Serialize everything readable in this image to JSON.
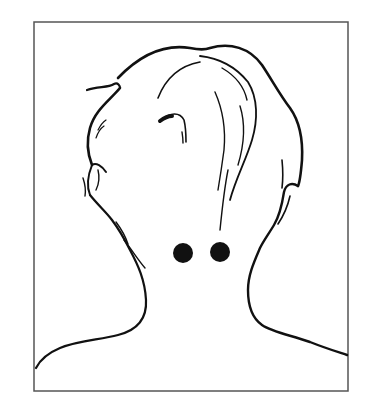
{
  "illustration": {
    "subject": "back of head and neck line drawing",
    "colors": {
      "background": "#ffffff",
      "line": "#111111",
      "frame": "#555555",
      "dot": "#111111"
    },
    "frame": {
      "x": 34,
      "y": 22,
      "width": 314,
      "height": 369
    },
    "points": [
      {
        "name": "left-point",
        "cx": 183,
        "cy": 253,
        "r": 10
      },
      {
        "name": "right-point",
        "cx": 220,
        "cy": 252,
        "r": 10
      }
    ]
  }
}
